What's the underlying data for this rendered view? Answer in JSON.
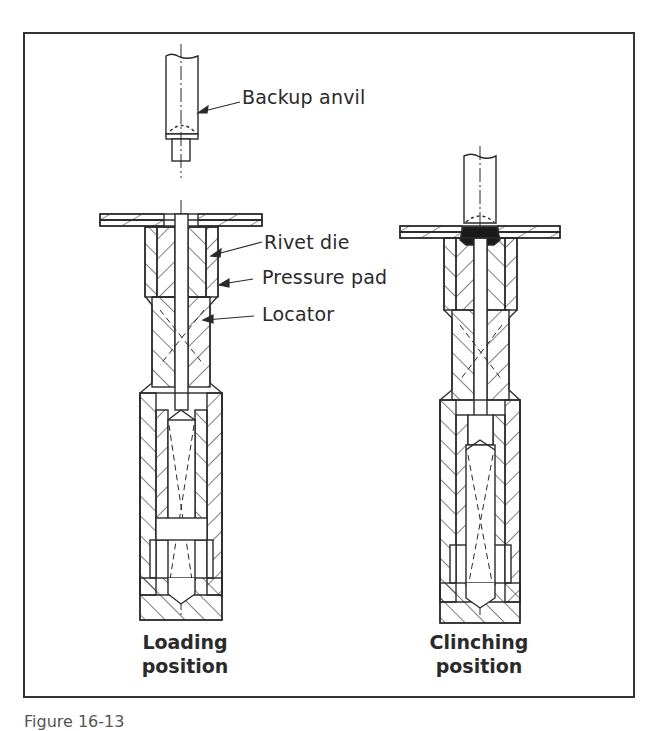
{
  "figure": {
    "labels": {
      "backup_anvil": "Backup anvil",
      "rivet_die": "Rivet die",
      "pressure_pad": "Pressure pad",
      "locator": "Locator"
    },
    "panels": [
      {
        "title_line1": "Loading",
        "title_line2": "position"
      },
      {
        "title_line1": "Clinching",
        "title_line2": "position"
      }
    ],
    "caption": "Figure 16-13"
  },
  "colors": {
    "line": "#2a2a2a",
    "frame": "#333333",
    "rivet_fill": "#1a1a1a",
    "background": "#ffffff"
  }
}
